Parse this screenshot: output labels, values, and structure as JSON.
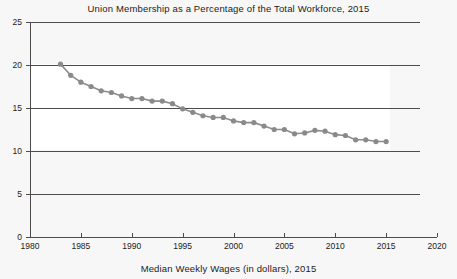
{
  "chart_data": {
    "type": "line",
    "title": "Union Membership as a Percentage of the Total Workforce, 2015",
    "caption": "Median Weekly Wages (in dollars), 2015",
    "xlabel": "",
    "ylabel": "",
    "xlim": [
      1980,
      2020
    ],
    "ylim": [
      0,
      25
    ],
    "grid": true,
    "legend": false,
    "xticks": [
      1980,
      1985,
      1990,
      1995,
      2000,
      2005,
      2010,
      2015,
      2020
    ],
    "yticks": [
      0,
      5,
      10,
      15,
      20,
      25
    ],
    "marker": "circle",
    "line_color": "#8c8c8c",
    "marker_color": "#8a8a8a",
    "grid_color": "#4c4c4c",
    "background_color": "#f7f7f7",
    "plot_band_color": "#ffffff",
    "series": [
      {
        "name": "Union membership (% of total workforce)",
        "x": [
          1983,
          1984,
          1985,
          1986,
          1987,
          1988,
          1989,
          1990,
          1991,
          1992,
          1993,
          1994,
          1995,
          1996,
          1997,
          1998,
          1999,
          2000,
          2001,
          2002,
          2003,
          2004,
          2005,
          2006,
          2007,
          2008,
          2009,
          2010,
          2011,
          2012,
          2013,
          2014,
          2015
        ],
        "values": [
          20.1,
          18.8,
          18.0,
          17.5,
          17.0,
          16.8,
          16.4,
          16.1,
          16.1,
          15.8,
          15.8,
          15.5,
          14.9,
          14.5,
          14.1,
          13.9,
          13.9,
          13.5,
          13.3,
          13.3,
          12.9,
          12.5,
          12.5,
          12.0,
          12.1,
          12.4,
          12.3,
          11.9,
          11.8,
          11.3,
          11.3,
          11.1,
          11.1
        ]
      }
    ]
  }
}
